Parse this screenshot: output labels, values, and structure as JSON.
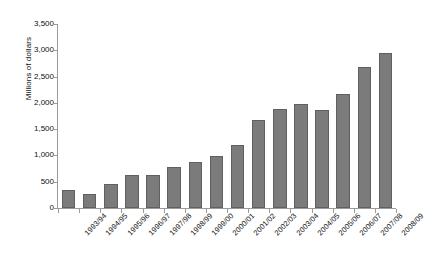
{
  "figure": {
    "top_note": "",
    "axis_color": "#9a9a9a",
    "bar_color": "#7b7b7b",
    "bar_edge_color": "#606060"
  },
  "chart_data": {
    "type": "bar",
    "title": "",
    "subtitle": "",
    "xlabel": "",
    "ylabel": "Millions of dollars",
    "ylim": [
      0,
      3500
    ],
    "ytick_labels": [
      "0",
      "500",
      "1,000",
      "1,500",
      "2,000",
      "2,500",
      "3,000",
      "3,500"
    ],
    "ytick_values": [
      0,
      500,
      1000,
      1500,
      2000,
      2500,
      3000,
      3500
    ],
    "grid": false,
    "legend": null,
    "categories": [
      "1993/94",
      "1994/95",
      "1995/96",
      "1996/97",
      "1997/98",
      "1998/99",
      "1999/00",
      "2000/01",
      "2001/02",
      "2002/03",
      "2003/04",
      "2004/05",
      "2005/06",
      "2006/07",
      "2007/08",
      "2008/09"
    ],
    "values": [
      345,
      275,
      455,
      630,
      620,
      785,
      880,
      985,
      1195,
      1670,
      1880,
      1980,
      1865,
      2175,
      2675,
      2945
    ]
  }
}
